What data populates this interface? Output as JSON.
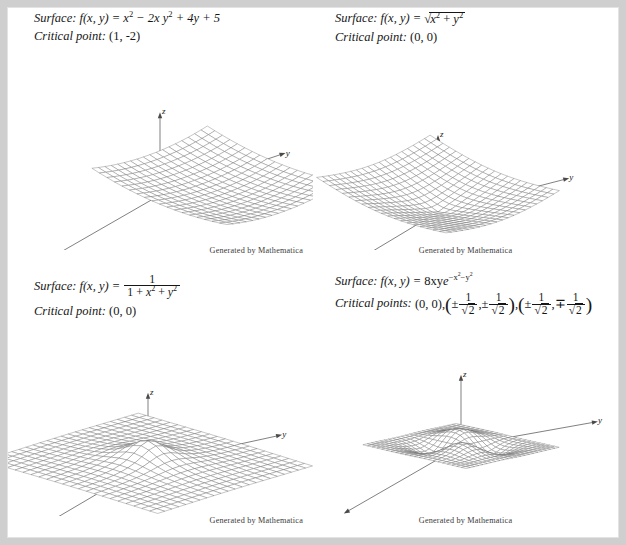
{
  "page": {
    "background": "#cfcfcf",
    "paper": "#ffffff",
    "caption": "Generated by Mathematica"
  },
  "labels": {
    "surface": "Surface:",
    "critical_point": "Critical point:",
    "critical_points": "Critical points:",
    "fn_head": "f(x, y) =",
    "axis_x": "x",
    "axis_y": "y",
    "axis_z": "z"
  },
  "panels": [
    {
      "id": "paraboloid",
      "surface_label": "Surface:",
      "formula_plain": "f(x, y) = x^2 - 2x + y^2 + 4y + 5",
      "critical_label": "Critical point:",
      "critical_plain": "(1, -2)",
      "caption": "Generated by Mathematica",
      "parts": {
        "x2": "x",
        "exp2": "2",
        "minus2x": "− 2x",
        "y2": "y",
        "plus4y": "+ 4y",
        "plus5": "+ 5",
        "plus": "+"
      }
    },
    {
      "id": "cone",
      "surface_label": "Surface:",
      "formula_plain": "f(x, y) = sqrt(x^2 + y^2)",
      "critical_label": "Critical point:",
      "critical_plain": "(0, 0)",
      "caption": "Generated by Mathematica",
      "parts": {
        "radical": "√",
        "x": "x",
        "y": "y",
        "exp2": "2",
        "plus": "+"
      }
    },
    {
      "id": "bell",
      "surface_label": "Surface:",
      "formula_plain": "f(x, y) = 1 / (1 + x^2 + y^2)",
      "critical_label": "Critical point:",
      "critical_plain": "(0, 0)",
      "caption": "Generated by Mathematica",
      "parts": {
        "numerator": "1",
        "den_one": "1",
        "x": "x",
        "y": "y",
        "exp2": "2",
        "plus": "+"
      }
    },
    {
      "id": "peaks",
      "surface_label": "Surface:",
      "formula_plain": "f(x, y) = 8xy e^(-x^2 - y^2)",
      "critical_label": "Critical points:",
      "critical_plain": "(0, 0), (±1/√2, ±1/√2), (±1/√2, ∓1/√2)",
      "caption": "Generated by Mathematica",
      "parts": {
        "coef": "8xy",
        "e": "e",
        "expo_minus": "−",
        "x": "x",
        "y": "y",
        "exp2": "2",
        "origin": "(0, 0),",
        "plusminus": "±",
        "minusplus": "∓",
        "one": "1",
        "radical": "√",
        "two": "2",
        "comma": ",",
        "paren_open": "(",
        "paren_close": ")"
      }
    }
  ],
  "chart_data": [
    {
      "type": "surface3d",
      "title": "f(x, y) = x^2 - 2x + y^2 + 4y + 5",
      "expr": "(u-1)*(u-1) + (v+2)*(v+2)",
      "domain": {
        "u": [
          -2.2,
          4.2
        ],
        "v": [
          -5.2,
          1.2
        ]
      },
      "grid": [
        18,
        18
      ],
      "critical_points": [
        [
          1,
          -2
        ]
      ],
      "zscale": 0.034,
      "view": {
        "ax": 0.96,
        "ay": 0.4,
        "bx": -0.82,
        "by": 0.3
      },
      "origin": [
        152,
        135
      ],
      "axes": {
        "x": [
          -2.0,
          1.15
        ],
        "y": [
          2.15,
          -0.72
        ],
        "z": [
          0,
          -1
        ]
      },
      "xlabel": "x",
      "ylabel": "y",
      "zlabel": "z"
    },
    {
      "type": "surface3d",
      "title": "f(x, y) = sqrt(x^2 + y^2)",
      "expr": "Math.sqrt(u*u + v*v)",
      "domain": {
        "u": [
          -3,
          3
        ],
        "v": [
          -3,
          3
        ]
      },
      "grid": [
        20,
        20
      ],
      "critical_points": [
        [
          0,
          0
        ]
      ],
      "zscale": 0.3,
      "view": {
        "ax": 0.98,
        "ay": 0.42,
        "bx": -0.86,
        "by": 0.32
      },
      "origin": [
        125,
        152
      ],
      "axes": {
        "x": [
          -1.75,
          1.05
        ],
        "y": [
          2.25,
          -0.58
        ],
        "z": [
          0,
          -1
        ]
      },
      "xlabel": "x",
      "ylabel": "y",
      "zlabel": "z"
    },
    {
      "type": "surface3d",
      "title": "f(x, y) = 1/(1 + x^2 + y^2)",
      "expr": "1/(1 + u*u + v*v)",
      "domain": {
        "u": [
          -4,
          4
        ],
        "v": [
          -4,
          4
        ]
      },
      "grid": [
        22,
        22
      ],
      "critical_points": [
        [
          0,
          0
        ]
      ],
      "zscale": 1.05,
      "view": {
        "ax": 0.99,
        "ay": 0.3,
        "bx": -0.88,
        "by": 0.27
      },
      "origin": [
        140,
        138
      ],
      "axes": {
        "x": [
          -1.7,
          1.0
        ],
        "y": [
          2.3,
          -0.5
        ],
        "z": [
          0,
          -1
        ]
      },
      "xlabel": "x",
      "ylabel": "y",
      "zlabel": "z"
    },
    {
      "type": "surface3d",
      "title": "f(x, y) = 8xy*exp(-x^2-y^2)",
      "expr": "8*u*v*Math.exp(-u*u - v*v)",
      "domain": {
        "u": [
          -2.3,
          2.3
        ],
        "v": [
          -2.3,
          2.3
        ]
      },
      "grid": [
        22,
        22
      ],
      "critical_points": [
        [
          0,
          0
        ],
        [
          0.7071,
          0.7071
        ],
        [
          -0.7071,
          -0.7071
        ],
        [
          0.7071,
          -0.7071
        ],
        [
          -0.7071,
          0.7071
        ]
      ],
      "zscale": 0.3,
      "view": {
        "ax": 1.02,
        "ay": 0.235,
        "bx": -0.92,
        "by": 0.21
      },
      "origin": [
        148,
        120
      ],
      "axes": {
        "x": [
          -1.65,
          0.95
        ],
        "y": [
          2.35,
          -0.42
        ],
        "z": [
          0,
          -1
        ]
      },
      "xlabel": "x",
      "ylabel": "y",
      "zlabel": "z"
    }
  ]
}
